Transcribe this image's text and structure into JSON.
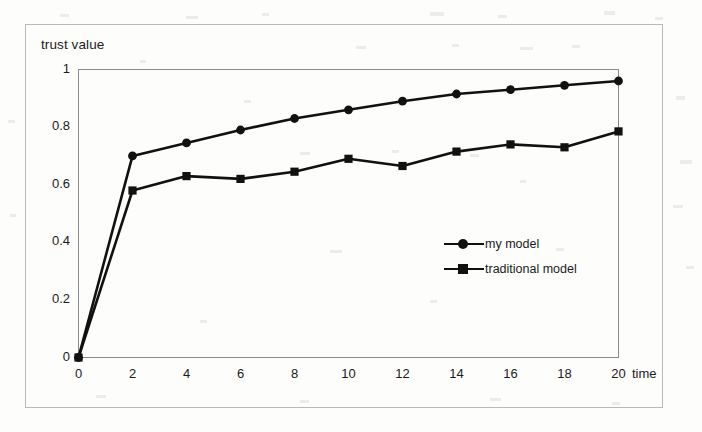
{
  "figure": {
    "y_axis_title": "trust value",
    "x_axis_title": "time",
    "background_color": "#fdfdfc",
    "frame_color": "#b9b9b9",
    "series_color": "#111111"
  },
  "legend": {
    "position": "inside-right",
    "entries": [
      {
        "label": "my model",
        "marker": "circle",
        "marker_icon": "circle-marker-icon"
      },
      {
        "label": "traditional model",
        "marker": "square",
        "marker_icon": "square-marker-icon"
      }
    ]
  },
  "chart_data": {
    "type": "line",
    "title": "",
    "subtitle": "",
    "xlabel": "time",
    "ylabel": "trust value",
    "xlim": [
      0,
      20
    ],
    "ylim": [
      0,
      1
    ],
    "grid": false,
    "legend_position": "inside-right",
    "xticks": [
      0,
      2,
      4,
      6,
      8,
      10,
      12,
      14,
      16,
      18,
      20
    ],
    "xtick_labels": [
      "0",
      "2",
      "4",
      "6",
      "8",
      "10",
      "12",
      "14",
      "16",
      "18",
      "20"
    ],
    "yticks": [
      0,
      0.2,
      0.4,
      0.6,
      0.8,
      1
    ],
    "ytick_labels": [
      "0",
      "0.2",
      "0.4",
      "0.6",
      "0.8",
      "1"
    ],
    "x": [
      0,
      2,
      4,
      6,
      8,
      10,
      12,
      14,
      16,
      18,
      20
    ],
    "series": [
      {
        "name": "my model",
        "marker": "circle",
        "values": [
          0.0,
          0.7,
          0.745,
          0.79,
          0.83,
          0.86,
          0.89,
          0.915,
          0.93,
          0.945,
          0.96
        ]
      },
      {
        "name": "traditional model",
        "marker": "square",
        "values": [
          0.0,
          0.58,
          0.63,
          0.62,
          0.645,
          0.69,
          0.665,
          0.715,
          0.74,
          0.73,
          0.785
        ]
      }
    ],
    "annotations": []
  }
}
